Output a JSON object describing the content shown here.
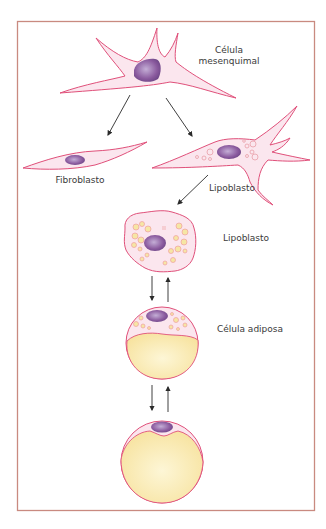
{
  "diagram": {
    "type": "cell-differentiation",
    "frame_color": "#c98a80",
    "colors": {
      "membrane": "#e0507a",
      "cytoplasm": "#fbe6ee",
      "nucleus": "#8a5a9e",
      "nucleus_light": "#b9a0cc",
      "lipid": "#f6e6a4",
      "lipid_edge": "#ef9f9f",
      "arrow": "#2a2a2a"
    },
    "nodes": [
      {
        "id": "mesenchymal",
        "label_line1": "Célula",
        "label_line2": "mesenquimal"
      },
      {
        "id": "fibroblast",
        "label": "Fibroblasto"
      },
      {
        "id": "lipoblast-early",
        "label": "Lipoblasto"
      },
      {
        "id": "lipoblast-round",
        "label": "Lipoblasto"
      },
      {
        "id": "adipocyte",
        "label": "Célula adiposa"
      },
      {
        "id": "mature-adipocyte",
        "label": ""
      }
    ],
    "edges": [
      {
        "from": "mesenchymal",
        "to": "fibroblast",
        "direction": "forward"
      },
      {
        "from": "mesenchymal",
        "to": "lipoblast-early",
        "direction": "forward"
      },
      {
        "from": "lipoblast-early",
        "to": "lipoblast-round",
        "direction": "forward"
      },
      {
        "from": "lipoblast-round",
        "to": "adipocyte",
        "direction": "bidirectional"
      },
      {
        "from": "adipocyte",
        "to": "mature-adipocyte",
        "direction": "bidirectional"
      }
    ]
  }
}
